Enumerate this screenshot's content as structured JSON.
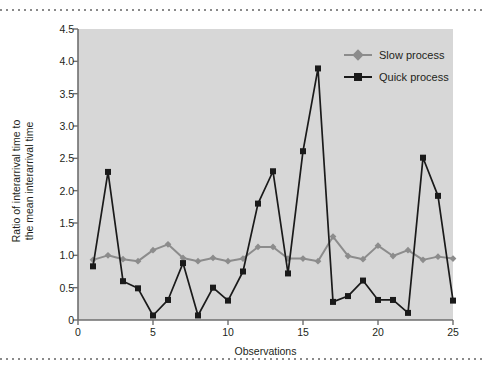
{
  "figure": {
    "background": "#ffffff",
    "plot_background": "#d7d7d7",
    "rule_top_name": "dotted-rule-top",
    "rule_bottom_name": "dotted-rule-bottom"
  },
  "colors": {
    "slow_process": "#8c8c8c",
    "quick_process": "#1a1a1a",
    "axis": "#6e6e6e",
    "text": "#231f20",
    "plot_bg": "#d7d7d7"
  },
  "chart_data": {
    "type": "line",
    "title": "",
    "xlabel": "Observations",
    "ylabel": "Ratio of interarrival time to the mean interarrival time",
    "ylabel_line1": "Ratio of interarrival time to",
    "ylabel_line2": "the mean interarrival time",
    "xlim": [
      0,
      25
    ],
    "ylim": [
      0,
      4.5
    ],
    "grid": false,
    "legend_position": "top-right inside plot",
    "xticks": [
      0,
      5,
      10,
      15,
      20,
      25
    ],
    "xtick_labels": [
      "0",
      "5",
      "10",
      "15",
      "20",
      "25"
    ],
    "yticks": [
      0,
      0.5,
      1.0,
      1.5,
      2.0,
      2.5,
      3.0,
      3.5,
      4.0,
      4.5
    ],
    "ytick_labels": [
      "0",
      "0.5",
      "1.0",
      "1.5",
      "2.0",
      "2.5",
      "3.0",
      "3.5",
      "4.0",
      "4.5"
    ],
    "x": [
      1,
      2,
      3,
      4,
      5,
      6,
      7,
      8,
      9,
      10,
      11,
      12,
      13,
      14,
      15,
      16,
      17,
      18,
      19,
      20,
      21,
      22,
      23,
      24,
      25
    ],
    "series": [
      {
        "name": "Slow process",
        "color": "#8c8c8c",
        "marker": "diamond",
        "values": [
          0.93,
          1.0,
          0.94,
          0.91,
          1.08,
          1.17,
          0.96,
          0.91,
          0.96,
          0.91,
          0.95,
          1.13,
          1.13,
          0.95,
          0.95,
          0.91,
          1.29,
          0.99,
          0.94,
          1.15,
          0.99,
          1.08,
          0.93,
          0.98,
          0.95
        ]
      },
      {
        "name": "Quick process",
        "color": "#1a1a1a",
        "marker": "square",
        "values": [
          0.83,
          2.29,
          0.6,
          0.49,
          0.07,
          0.31,
          0.88,
          0.07,
          0.5,
          0.3,
          0.75,
          1.8,
          2.3,
          0.72,
          2.61,
          3.89,
          0.28,
          0.37,
          0.61,
          0.31,
          0.31,
          0.11,
          2.51,
          1.92,
          0.3
        ]
      }
    ]
  },
  "legend": {
    "items": [
      {
        "label": "Slow process",
        "color": "#8c8c8c",
        "marker": "diamond"
      },
      {
        "label": "Quick process",
        "color": "#1a1a1a",
        "marker": "square"
      }
    ]
  }
}
